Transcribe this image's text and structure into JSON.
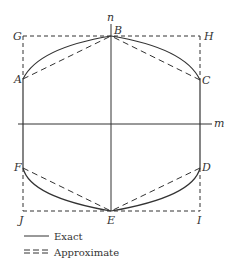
{
  "diagram": {
    "colors": {
      "stroke": "#333333",
      "background": "#ffffff"
    },
    "axes": {
      "horizontal_label": "m",
      "vertical_label": "n"
    },
    "points": {
      "A": "A",
      "B": "B",
      "C": "C",
      "D": "D",
      "E": "E",
      "F": "F",
      "G": "G",
      "H": "H",
      "I": "I",
      "J": "J"
    },
    "legend": [
      {
        "style": "solid",
        "label": "Exact"
      },
      {
        "style": "dashed",
        "label": "Approximate"
      }
    ]
  }
}
